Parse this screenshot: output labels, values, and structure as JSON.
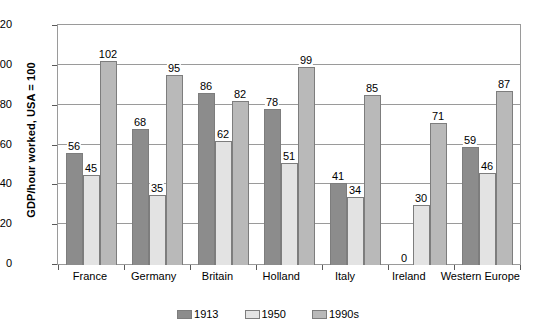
{
  "chart_data": {
    "type": "bar",
    "title": "",
    "xlabel": "",
    "ylabel": "GDP/hour worked, USA = 100",
    "ylim": [
      0,
      120
    ],
    "yticks": [
      0,
      20,
      40,
      60,
      80,
      100,
      120
    ],
    "grid": true,
    "legend_position": "bottom",
    "categories": [
      "France",
      "Germany",
      "Britain",
      "Holland",
      "Italy",
      "Ireland",
      "Western Europe"
    ],
    "series": [
      {
        "name": "1913",
        "color": "#8c8c8c",
        "values": [
          56,
          68,
          86,
          78,
          41,
          0,
          59
        ],
        "labels": [
          "56",
          "68",
          "86",
          "78",
          "41",
          "0",
          "59"
        ]
      },
      {
        "name": "1950",
        "color": "#e3e3e3",
        "values": [
          45,
          35,
          62,
          51,
          34,
          30,
          46
        ],
        "labels": [
          "45",
          "35",
          "62",
          "51",
          "34",
          "30",
          "46"
        ]
      },
      {
        "name": "1990s",
        "color": "#b9b9b9",
        "values": [
          102,
          95,
          82,
          99,
          85,
          71,
          87
        ],
        "labels": [
          "102",
          "95",
          "82",
          "99",
          "85",
          "71",
          "87"
        ]
      }
    ]
  },
  "axis": {
    "y_title": "GDP/hour worked, USA = 100",
    "y_tick_labels": [
      "0",
      "20",
      "40",
      "60",
      "80",
      "100",
      "120"
    ]
  },
  "legend": {
    "items": [
      {
        "label": "1913",
        "color": "#8c8c8c"
      },
      {
        "label": "1950",
        "color": "#e3e3e3"
      },
      {
        "label": "1990s",
        "color": "#b9b9b9"
      }
    ]
  }
}
